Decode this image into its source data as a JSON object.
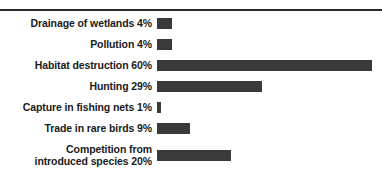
{
  "chart_data": {
    "type": "bar",
    "orientation": "horizontal",
    "title": "",
    "subtitle": "",
    "xlabel": "",
    "ylabel": "",
    "xlim": [
      0,
      60
    ],
    "grid": false,
    "legend": false,
    "bar_color": "#3a3a3a",
    "rule_color": "#2b2b2b",
    "units": "%",
    "categories": [
      "Drainage of wetlands",
      "Pollution",
      "Habitat destruction",
      "Hunting",
      "Capture in fishing nets",
      "Trade in rare birds",
      "Competition from introduced species"
    ],
    "values": [
      4,
      4,
      60,
      29,
      1,
      9,
      20
    ],
    "labels": [
      "Drainage of wetlands 4%",
      "Pollution 4%",
      "Habitat destruction 60%",
      "Hunting 29%",
      "Capture in fishing nets 1%",
      "Trade in rare birds 9%",
      "Competition from\nintroduced species 20%"
    ],
    "bar_widths_px": [
      15,
      15,
      215,
      105,
      4,
      33,
      74
    ]
  }
}
